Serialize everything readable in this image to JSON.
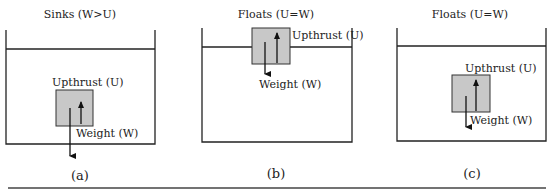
{
  "panels": [
    {
      "id": "a",
      "title": "Sinks (W>U)",
      "upthrust_label": "Upthrust (U)",
      "weight_label": "Weight (W)",
      "caption": "(a)"
    },
    {
      "id": "b",
      "title": "Floats (U=W)",
      "upthrust_label": "Upthrust (U)",
      "weight_label": "Weight (W)",
      "caption": "(b)"
    },
    {
      "id": "c",
      "title": "Floats (U=W)",
      "upthrust_label": "Upthrust (U)",
      "weight_label": "Weight (W)",
      "caption": "(c)"
    }
  ],
  "colors": {
    "line": "#222222",
    "block": "#c8c8c8",
    "block_border": "#333333"
  }
}
